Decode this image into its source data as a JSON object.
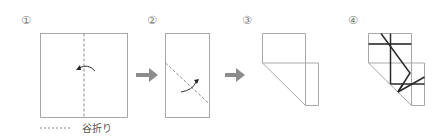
{
  "steps": [
    {
      "number": "①"
    },
    {
      "number": "②"
    },
    {
      "number": "③"
    },
    {
      "number": "④"
    }
  ],
  "legend": {
    "label": "谷折り",
    "line_style": "dashed"
  },
  "colors": {
    "paper_outline": "#a8a8a8",
    "fold_line": "#8a8a8a",
    "step_arrow": "#8c8c8c",
    "fold_arrow": "#333333",
    "bold_line": "#2a2a2a"
  }
}
